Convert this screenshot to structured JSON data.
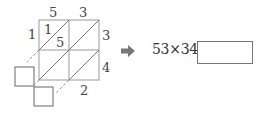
{
  "lattice": {
    "top_digits": [
      "5",
      "3"
    ],
    "right_digits": [
      "3",
      "4"
    ],
    "cell_top_left_upper": "1",
    "cell_top_left_lower": "5",
    "left_carry": "1",
    "bottom_digit": "2"
  },
  "equation": {
    "text": "53×34=",
    "answer": ""
  },
  "colors": {
    "line": "#888888",
    "box": "#777777",
    "arrow": "#777777"
  }
}
